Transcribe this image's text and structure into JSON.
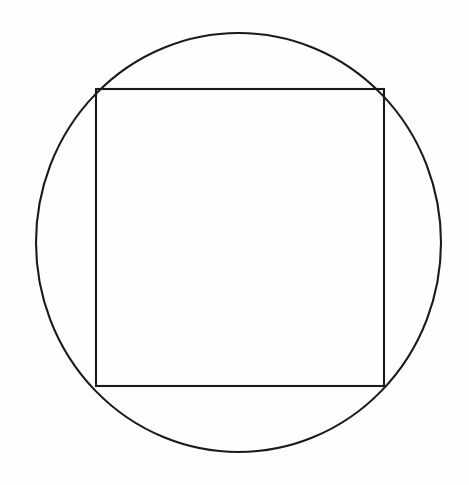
{
  "figure": {
    "title": "Square inscribed in a circle",
    "background_color": "#fefefe",
    "stroke_color": "#1a1a1a",
    "canvas": {
      "width": 469,
      "height": 485
    }
  },
  "chart_data": {
    "type": "diagram",
    "title": "Square inscribed in a circle",
    "subtitle": "",
    "xlabel": "",
    "ylabel": "",
    "grid": false,
    "legend": "none",
    "axis_visible": false,
    "tick_labels": [],
    "annotations": [],
    "units": "pixels",
    "coordinate_system": "image pixels, origin top-left, y increases downward",
    "xlim": [
      0,
      469
    ],
    "ylim": [
      0,
      485
    ],
    "shapes": [
      {
        "name": "circumscribed-circle",
        "type": "ellipse",
        "center_x": 238.5,
        "center_y": 242.5,
        "radius_x": 202.5,
        "radius_y": 209.5,
        "bbox_left": 36,
        "bbox_top": 33,
        "bbox_right": 441,
        "bbox_bottom": 452,
        "width": 405,
        "height": 419,
        "stroke_color": "#1a1a1a",
        "stroke_width": 2.1,
        "fill": "none"
      },
      {
        "name": "inscribed-square",
        "type": "rectangle",
        "left": 96,
        "top": 89,
        "right": 384,
        "bottom": 386,
        "width": 288,
        "height": 297,
        "center_x": 240,
        "center_y": 237.5,
        "stroke_color": "#1a1a1a",
        "stroke_width": 2.1,
        "fill": "none",
        "corners": [
          {
            "name": "top-left",
            "x": 96,
            "y": 89
          },
          {
            "name": "top-right",
            "x": 384,
            "y": 89
          },
          {
            "name": "bottom-right",
            "x": 384,
            "y": 386
          },
          {
            "name": "bottom-left",
            "x": 96,
            "y": 386
          }
        ]
      }
    ],
    "relationships": [
      "All four corners of the rectangle lie on the circle",
      "The rectangle is inscribed in the circle",
      "The circle is circumscribed about the rectangle"
    ]
  }
}
